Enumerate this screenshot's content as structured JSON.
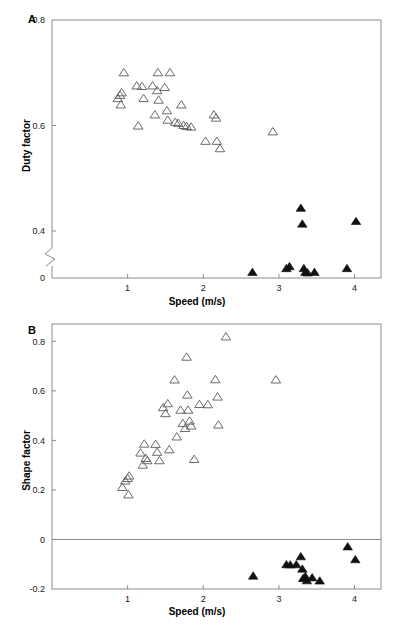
{
  "figure": {
    "panels": [
      {
        "letter": "A",
        "xlabel": "Speed (m/s)",
        "ylabel": "Duty factor",
        "xticks": [
          "1",
          "2",
          "3",
          "4"
        ],
        "yticks": [
          "0.8",
          "0.6",
          "0.4",
          "0"
        ]
      },
      {
        "letter": "B",
        "xlabel": "Speed (m/s)",
        "ylabel": "Shape factor",
        "xticks": [
          "1",
          "2",
          "3",
          "4"
        ],
        "yticks": [
          "0.8",
          "0.6",
          "0.4",
          "0.2",
          "0",
          "-0.2"
        ]
      }
    ]
  },
  "chart_data": [
    {
      "type": "scatter",
      "panel": "A",
      "title": "",
      "xlabel": "Speed (m/s)",
      "ylabel": "Duty factor",
      "xlim": [
        0.0,
        4.35
      ],
      "ylim": [
        0.0,
        0.8
      ],
      "y_axis_break": {
        "between": [
          0.05,
          0.36
        ],
        "note": "axis break between 0 and 0.4"
      },
      "xticks": [
        1,
        2,
        3,
        4
      ],
      "yticks": [
        0,
        0.4,
        0.6,
        0.8
      ],
      "grid": false,
      "legend": null,
      "series": [
        {
          "name": "open-triangle",
          "marker": "triangle-open",
          "points": [
            [
              0.87,
              0.651
            ],
            [
              0.9,
              0.657
            ],
            [
              0.91,
              0.639
            ],
            [
              0.92,
              0.662
            ],
            [
              0.95,
              0.7
            ],
            [
              1.12,
              0.675
            ],
            [
              1.14,
              0.599
            ],
            [
              1.19,
              0.674
            ],
            [
              1.21,
              0.651
            ],
            [
              1.33,
              0.675
            ],
            [
              1.36,
              0.62
            ],
            [
              1.39,
              0.666
            ],
            [
              1.4,
              0.7
            ],
            [
              1.41,
              0.648
            ],
            [
              1.49,
              0.672
            ],
            [
              1.52,
              0.628
            ],
            [
              1.53,
              0.61
            ],
            [
              1.56,
              0.7
            ],
            [
              1.63,
              0.606
            ],
            [
              1.67,
              0.604
            ],
            [
              1.71,
              0.639
            ],
            [
              1.74,
              0.6
            ],
            [
              1.78,
              0.598
            ],
            [
              1.84,
              0.597
            ],
            [
              2.03,
              0.57
            ],
            [
              2.14,
              0.62
            ],
            [
              2.17,
              0.614
            ],
            [
              2.18,
              0.57
            ],
            [
              2.22,
              0.556
            ],
            [
              2.92,
              0.588
            ]
          ]
        },
        {
          "name": "filled-triangle",
          "marker": "triangle-filled",
          "points": [
            [
              2.65,
              0.185
            ],
            [
              3.1,
              0.312
            ],
            [
              3.14,
              0.377
            ],
            [
              3.29,
              0.443
            ],
            [
              3.31,
              0.413
            ],
            [
              3.33,
              0.312
            ],
            [
              3.35,
              0.185
            ],
            [
              3.38,
              0.166
            ],
            [
              3.47,
              0.186
            ],
            [
              3.9,
              0.312
            ],
            [
              4.02,
              0.418
            ]
          ]
        }
      ]
    },
    {
      "type": "scatter",
      "panel": "B",
      "title": "",
      "xlabel": "Speed (m/s)",
      "ylabel": "Shape factor",
      "xlim": [
        0.0,
        4.35
      ],
      "ylim": [
        -0.2,
        0.87
      ],
      "xticks": [
        1,
        2,
        3,
        4
      ],
      "yticks": [
        -0.2,
        0,
        0.2,
        0.4,
        0.6,
        0.8
      ],
      "grid": false,
      "zero_reference_line": 0,
      "legend": null,
      "series": [
        {
          "name": "open-triangle",
          "marker": "triangle-open",
          "points": [
            [
              0.93,
              0.21
            ],
            [
              0.97,
              0.236
            ],
            [
              1.0,
              0.246
            ],
            [
              1.02,
              0.256
            ],
            [
              1.01,
              0.18
            ],
            [
              1.17,
              0.349
            ],
            [
              1.2,
              0.3
            ],
            [
              1.22,
              0.385
            ],
            [
              1.24,
              0.327
            ],
            [
              1.26,
              0.318
            ],
            [
              1.37,
              0.384
            ],
            [
              1.39,
              0.352
            ],
            [
              1.42,
              0.318
            ],
            [
              1.47,
              0.532
            ],
            [
              1.5,
              0.508
            ],
            [
              1.53,
              0.548
            ],
            [
              1.55,
              0.362
            ],
            [
              1.62,
              0.644
            ],
            [
              1.65,
              0.414
            ],
            [
              1.7,
              0.522
            ],
            [
              1.73,
              0.468
            ],
            [
              1.76,
              0.448
            ],
            [
              1.78,
              0.736
            ],
            [
              1.79,
              0.583
            ],
            [
              1.8,
              0.522
            ],
            [
              1.82,
              0.478
            ],
            [
              1.84,
              0.458
            ],
            [
              1.88,
              0.323
            ],
            [
              1.95,
              0.545
            ],
            [
              2.06,
              0.544
            ],
            [
              2.16,
              0.645
            ],
            [
              2.19,
              0.575
            ],
            [
              2.2,
              0.462
            ],
            [
              2.3,
              0.818
            ],
            [
              2.96,
              0.644
            ]
          ]
        },
        {
          "name": "filled-triangle",
          "marker": "triangle-filled",
          "points": [
            [
              2.66,
              -0.148
            ],
            [
              3.1,
              -0.102
            ],
            [
              3.15,
              -0.103
            ],
            [
              3.23,
              -0.102
            ],
            [
              3.29,
              -0.07
            ],
            [
              3.31,
              -0.12
            ],
            [
              3.32,
              -0.158
            ],
            [
              3.35,
              -0.15
            ],
            [
              3.37,
              -0.167
            ],
            [
              3.44,
              -0.155
            ],
            [
              3.54,
              -0.168
            ],
            [
              3.91,
              -0.03
            ],
            [
              4.01,
              -0.082
            ]
          ]
        }
      ]
    }
  ]
}
